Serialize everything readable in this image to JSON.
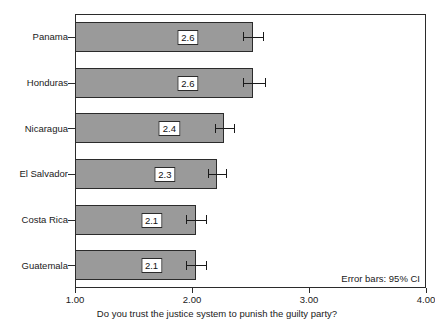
{
  "chart_data": {
    "type": "bar",
    "orientation": "horizontal",
    "title": "",
    "xlabel": "Do you trust the justice system to punish the guilty party?",
    "ylabel": "",
    "xlim": [
      1.0,
      4.0
    ],
    "grid": false,
    "legend": null,
    "annotation": "Error bars: 95% CI",
    "xticks": [
      "1.00",
      "2.00",
      "3.00",
      "4.00"
    ],
    "xtick_values": [
      1.0,
      2.0,
      3.0,
      4.0
    ],
    "categories": [
      "Panama",
      "Honduras",
      "Nicaragua",
      "El Salvador",
      "Costa Rica",
      "Guatemala"
    ],
    "values": [
      2.52,
      2.52,
      2.27,
      2.21,
      2.03,
      2.03
    ],
    "data_labels": [
      "2.6",
      "2.6",
      "2.4",
      "2.3",
      "2.1",
      "2.1"
    ],
    "error_low": [
      2.44,
      2.44,
      2.2,
      2.14,
      1.95,
      1.95
    ],
    "error_high": [
      2.61,
      2.62,
      2.36,
      2.29,
      2.12,
      2.12
    ],
    "bar_color": "#9a9a9a",
    "bar_edge_color": "#2b2b2b",
    "error_color": "#1a1a1a"
  },
  "labels": {
    "c0": "Panama",
    "c1": "Honduras",
    "c2": "Nicaragua",
    "c3": "El Salvador",
    "c4": "Costa Rica",
    "c5": "Guatemala"
  },
  "datalabels": {
    "d0": "2.6",
    "d1": "2.6",
    "d2": "2.4",
    "d3": "2.3",
    "d4": "2.1",
    "d5": "2.1"
  },
  "xaxis": {
    "t0": "1.00",
    "t1": "2.00",
    "t2": "3.00",
    "t3": "4.00",
    "title": "Do you trust the justice system to punish the guilty party?"
  },
  "note": {
    "error_bars": "Error bars: 95% CI"
  }
}
